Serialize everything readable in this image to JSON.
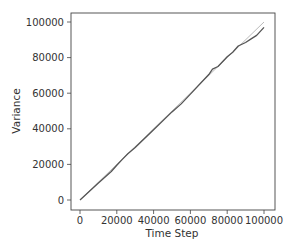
{
  "chart_data": {
    "type": "line",
    "title": "",
    "xlabel": "Time Step",
    "ylabel": "Variance",
    "xlim": [
      -5000,
      105000
    ],
    "ylim": [
      -5000,
      106000
    ],
    "xticks": [
      0,
      20000,
      40000,
      60000,
      80000,
      100000
    ],
    "yticks": [
      0,
      20000,
      40000,
      60000,
      80000,
      100000
    ],
    "xtick_labels": [
      "0",
      "20000",
      "40000",
      "60000",
      "80000",
      "100000"
    ],
    "ytick_labels": [
      "0",
      "20000",
      "40000",
      "60000",
      "80000",
      "100000"
    ],
    "grid": false,
    "legend": null,
    "series": [
      {
        "name": "empirical variance",
        "color": "#555555",
        "x": [
          0,
          10000,
          17000,
          20000,
          23000,
          26000,
          30000,
          40000,
          50000,
          55000,
          60000,
          65000,
          70000,
          72000,
          75000,
          80000,
          83000,
          86000,
          90000,
          93000,
          96000,
          100000
        ],
        "y": [
          0,
          9500,
          16000,
          19500,
          22800,
          26000,
          29500,
          39500,
          49500,
          54000,
          59500,
          65000,
          70500,
          73500,
          75000,
          80500,
          83000,
          86500,
          88500,
          90500,
          92500,
          97000
        ]
      },
      {
        "name": "theoretical variance",
        "color": "#bbbbbb",
        "x": [
          0,
          100000
        ],
        "y": [
          0,
          100000
        ]
      }
    ]
  }
}
